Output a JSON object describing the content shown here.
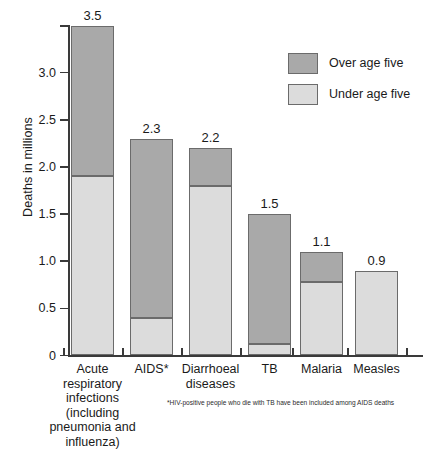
{
  "chart_data": {
    "type": "bar",
    "title": "",
    "subtitle": "",
    "xlabel": "",
    "ylabel": "Deaths in millions",
    "ylim": [
      0,
      3.5
    ],
    "ytick_values": [
      0,
      0.5,
      1.0,
      1.5,
      2.0,
      2.5,
      3.0
    ],
    "ytick_labels": [
      "0",
      "0.5",
      "1.0",
      "1.5",
      "2.0",
      "2.5",
      "3.0"
    ],
    "grid": false,
    "stacked": true,
    "legend_position": "top-right",
    "categories": [
      "Acute\nrespiratory\ninfections\n(including\npneumonia and\ninfluenza)",
      "AIDS*",
      "Diarrhoeal\ndiseases",
      "TB",
      "Malaria",
      "Measles"
    ],
    "series": [
      {
        "name": "Under age five",
        "color": "#dcdcdc",
        "values": [
          1.9,
          0.4,
          1.8,
          0.12,
          0.78,
          0.9
        ]
      },
      {
        "name": "Over age five",
        "color": "#a9a9a9",
        "values": [
          1.6,
          1.9,
          0.4,
          1.38,
          0.32,
          0.0
        ]
      }
    ],
    "totals": [
      3.5,
      2.3,
      2.2,
      1.5,
      1.1,
      0.9
    ],
    "total_labels": [
      "3.5",
      "2.3",
      "2.2",
      "1.5",
      "1.1",
      "0.9"
    ],
    "annotations": [
      "*HIV-positive people who die with TB have been included among AIDS deaths"
    ]
  },
  "legend": {
    "items": [
      {
        "label": "Over age five",
        "color": "#a9a9a9"
      },
      {
        "label": "Under age five",
        "color": "#dcdcdc"
      }
    ]
  },
  "footnote": {
    "text": "*HIV-positive people who die with TB have been included among AIDS deaths"
  },
  "colors": {
    "over_age_five": "#a9a9a9",
    "under_age_five": "#dcdcdc",
    "axis": "#3a3a3a",
    "bar_border": "#6b6b6b",
    "text": "#1a1a1a",
    "background": "#ffffff"
  }
}
